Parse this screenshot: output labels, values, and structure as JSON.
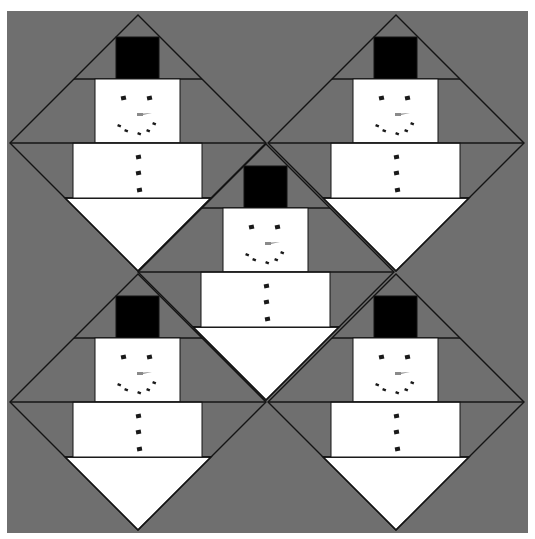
{
  "pattern": {
    "subject": "snowman quilt block layout",
    "block_count": 5,
    "colors": {
      "page_background": "#ffffff",
      "background_fabric": "#6f6f6f",
      "snow": "#ffffff",
      "hat": "#000000",
      "outline": "#141414",
      "features": "#1a1a1a",
      "nose": "#8a8a8a"
    },
    "field": {
      "x": 7,
      "y": 11,
      "width": 521,
      "height": 522
    },
    "block_half_size": 128,
    "blocks": [
      {
        "id": "top-left",
        "cx": 138,
        "cy": 143
      },
      {
        "id": "top-right",
        "cx": 396,
        "cy": 143
      },
      {
        "id": "center",
        "cx": 266,
        "cy": 272
      },
      {
        "id": "bottom-left",
        "cx": 138,
        "cy": 402
      },
      {
        "id": "bottom-right",
        "cx": 396,
        "cy": 402
      }
    ],
    "geometry": {
      "hat": {
        "x0": -22,
        "x1": 21,
        "y0": -106,
        "y1": -64
      },
      "head": {
        "x0": -43,
        "x1": 42,
        "y0": -64,
        "y1": 0
      },
      "body": {
        "x0": -65,
        "x1": 64,
        "y0": 0,
        "y1": 55
      },
      "eyes": [
        {
          "dx": -17,
          "dy": -47,
          "w": 5,
          "h": 4
        },
        {
          "dx": 9,
          "dy": -47,
          "w": 5,
          "h": 4
        }
      ],
      "nose": {
        "x0": -1,
        "x1": 14,
        "y0": -30,
        "y1": -27
      },
      "mouth": [
        {
          "dx": -20,
          "dy": -19
        },
        {
          "dx": -13,
          "dy": -14
        },
        {
          "dx": 0,
          "dy": -11
        },
        {
          "dx": 9,
          "dy": -14
        },
        {
          "dx": 15,
          "dy": -21
        }
      ],
      "buttons": [
        {
          "dx": -2,
          "dy": 12
        },
        {
          "dx": -2,
          "dy": 28
        },
        {
          "dx": -1,
          "dy": 45
        }
      ]
    }
  }
}
